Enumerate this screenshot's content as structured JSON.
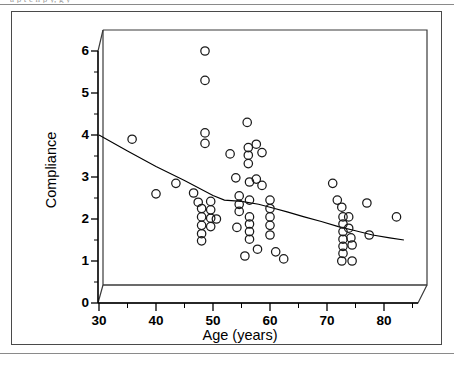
{
  "figure": {
    "caption_sliver": "a  p        t        e  n      p         y,           g    y",
    "background_color": "#ffffff",
    "line_color": "#000000",
    "marker_stroke_color": "#1a1a1a",
    "marker_fill": "none",
    "frame_color": "#4a4a4a"
  },
  "axes": {
    "xlabel": "Age (years)",
    "ylabel": "Compliance",
    "x_ticks": [
      30,
      40,
      50,
      60,
      70,
      80
    ],
    "x_tick_labels": [
      "30",
      "40",
      "50",
      "60",
      "70",
      "80"
    ],
    "x_minor_ticks": [
      35,
      45,
      55,
      65,
      75,
      85
    ],
    "y_ticks": [
      0,
      1,
      2,
      3,
      4,
      5,
      6
    ],
    "y_tick_labels": [
      "0",
      "1",
      "2",
      "3",
      "4",
      "5",
      "6"
    ],
    "xlim": [
      30,
      85
    ],
    "ylim": [
      0,
      6.4
    ],
    "grid": false,
    "style": "3d-walled-box"
  },
  "chart_data": {
    "type": "scatter",
    "title": "",
    "xlabel": "Age (years)",
    "ylabel": "Compliance",
    "xlim": [
      30,
      85
    ],
    "ylim": [
      0,
      6.4
    ],
    "grid": false,
    "legend": null,
    "marker": "open-circle",
    "points": [
      [
        35.8,
        3.9
      ],
      [
        40.0,
        2.6
      ],
      [
        43.5,
        2.85
      ],
      [
        48.6,
        6.0
      ],
      [
        48.6,
        5.3
      ],
      [
        48.6,
        4.05
      ],
      [
        48.6,
        3.8
      ],
      [
        46.6,
        2.62
      ],
      [
        47.4,
        2.4
      ],
      [
        48.0,
        2.25
      ],
      [
        48.0,
        2.05
      ],
      [
        48.0,
        1.85
      ],
      [
        48.0,
        1.65
      ],
      [
        48.0,
        1.48
      ],
      [
        49.6,
        2.42
      ],
      [
        49.6,
        2.22
      ],
      [
        49.6,
        2.02
      ],
      [
        49.6,
        1.82
      ],
      [
        50.6,
        2.0
      ],
      [
        53.0,
        3.55
      ],
      [
        54.0,
        2.98
      ],
      [
        54.6,
        2.55
      ],
      [
        54.6,
        2.35
      ],
      [
        54.6,
        2.18
      ],
      [
        54.2,
        1.8
      ],
      [
        56.0,
        4.3
      ],
      [
        56.2,
        3.7
      ],
      [
        56.2,
        3.52
      ],
      [
        56.2,
        3.32
      ],
      [
        56.4,
        2.88
      ],
      [
        56.4,
        2.45
      ],
      [
        56.4,
        2.05
      ],
      [
        56.4,
        1.88
      ],
      [
        56.4,
        1.7
      ],
      [
        56.4,
        1.52
      ],
      [
        55.6,
        1.12
      ],
      [
        57.6,
        3.78
      ],
      [
        57.6,
        2.95
      ],
      [
        57.8,
        1.28
      ],
      [
        58.6,
        3.58
      ],
      [
        58.6,
        2.8
      ],
      [
        60.0,
        2.45
      ],
      [
        60.0,
        2.25
      ],
      [
        60.0,
        2.05
      ],
      [
        60.0,
        1.85
      ],
      [
        60.0,
        1.62
      ],
      [
        61.0,
        1.22
      ],
      [
        62.4,
        1.05
      ],
      [
        71.0,
        2.85
      ],
      [
        71.8,
        2.45
      ],
      [
        72.6,
        2.28
      ],
      [
        72.8,
        2.05
      ],
      [
        72.8,
        1.88
      ],
      [
        72.8,
        1.7
      ],
      [
        72.8,
        1.52
      ],
      [
        72.8,
        1.35
      ],
      [
        72.8,
        1.18
      ],
      [
        72.6,
        1.0
      ],
      [
        73.8,
        2.05
      ],
      [
        73.8,
        1.78
      ],
      [
        74.2,
        1.55
      ],
      [
        74.4,
        1.38
      ],
      [
        74.4,
        1.0
      ],
      [
        77.0,
        2.38
      ],
      [
        77.4,
        1.62
      ],
      [
        82.2,
        2.05
      ]
    ],
    "fit_line": {
      "label": "lowess trend",
      "points": [
        [
          30.0,
          4.0
        ],
        [
          35.0,
          3.62
        ],
        [
          40.0,
          3.25
        ],
        [
          45.0,
          2.92
        ],
        [
          50.0,
          2.56
        ],
        [
          52.0,
          2.45
        ],
        [
          55.0,
          2.42
        ],
        [
          58.0,
          2.35
        ],
        [
          60.0,
          2.28
        ],
        [
          63.0,
          2.17
        ],
        [
          66.0,
          2.05
        ],
        [
          69.0,
          1.94
        ],
        [
          72.0,
          1.82
        ],
        [
          75.0,
          1.72
        ],
        [
          78.0,
          1.62
        ],
        [
          81.0,
          1.55
        ],
        [
          83.5,
          1.5
        ]
      ]
    }
  }
}
